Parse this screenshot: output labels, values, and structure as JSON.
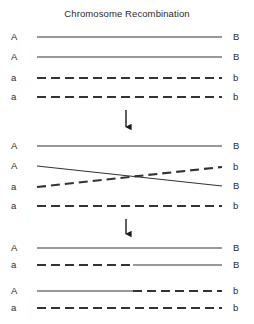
{
  "figure": {
    "title": "Chromosome Recombination",
    "width": 254,
    "height": 324,
    "background": "#ffffff",
    "stroke_color": "#333333",
    "text_color": "#2b2b2b"
  },
  "geometry": {
    "line_start_x": 37,
    "line_end_x": 222,
    "left_label_x": 11,
    "right_label_x": 233,
    "dash_pattern": "9 5",
    "solid_stroke_width": 1.1,
    "dashed_stroke_width": 2.2,
    "crossover_x": 100,
    "recombination_switch_x": 133
  },
  "stages": [
    {
      "id": "stage-1-homologous-pairing",
      "name": "Homologous chromosome pair",
      "chromatids": [
        {
          "id": "s1-c1",
          "left_label": "A",
          "right_label": "B",
          "y": 37,
          "style": "solid",
          "segments": [
            {
              "from_x": 37,
              "to_x": 222,
              "from_y": 37,
              "to_y": 37,
              "style": "solid"
            }
          ]
        },
        {
          "id": "s1-c2",
          "left_label": "A",
          "right_label": "B",
          "y": 57,
          "style": "solid",
          "segments": [
            {
              "from_x": 37,
              "to_x": 222,
              "from_y": 57,
              "to_y": 57,
              "style": "solid"
            }
          ]
        },
        {
          "id": "s1-c3",
          "left_label": "a",
          "right_label": "b",
          "y": 78,
          "style": "dashed",
          "segments": [
            {
              "from_x": 37,
              "to_x": 222,
              "from_y": 78,
              "to_y": 78,
              "style": "dashed"
            }
          ]
        },
        {
          "id": "s1-c4",
          "left_label": "a",
          "right_label": "b",
          "y": 97,
          "style": "dashed",
          "segments": [
            {
              "from_x": 37,
              "to_x": 222,
              "from_y": 97,
              "to_y": 97,
              "style": "dashed"
            }
          ]
        }
      ]
    },
    {
      "id": "stage-2-crossover",
      "name": "Crossover / chiasma formation",
      "chromatids": [
        {
          "id": "s2-c1",
          "left_label": "A",
          "right_label": "B",
          "y": 146,
          "style": "solid",
          "segments": [
            {
              "from_x": 37,
              "to_x": 222,
              "from_y": 146,
              "to_y": 146,
              "style": "solid"
            }
          ]
        },
        {
          "id": "s2-c2",
          "left_label": "A",
          "right_label": "B",
          "y": 166,
          "style": "solid",
          "segments": [
            {
              "from_x": 37,
              "to_x": 222,
              "from_y": 166,
              "to_y": 186,
              "style": "solid"
            }
          ]
        },
        {
          "id": "s2-c3",
          "left_label": "a",
          "right_label": "b",
          "y": 187,
          "style": "dashed",
          "segments": [
            {
              "from_x": 37,
              "to_x": 222,
              "from_y": 187,
              "to_y": 167,
              "style": "dashed"
            }
          ]
        },
        {
          "id": "s2-c4",
          "left_label": "a",
          "right_label": "b",
          "y": 206,
          "style": "dashed",
          "segments": [
            {
              "from_x": 37,
              "to_x": 222,
              "from_y": 206,
              "to_y": 206,
              "style": "dashed"
            }
          ]
        }
      ]
    },
    {
      "id": "stage-3-recombinant-products",
      "name": "Recombinant and parental chromatids",
      "chromatids": [
        {
          "id": "s3-c1",
          "left_label": "A",
          "right_label": "B",
          "y": 248,
          "style": "solid",
          "segments": [
            {
              "from_x": 37,
              "to_x": 222,
              "from_y": 248,
              "to_y": 248,
              "style": "solid"
            }
          ]
        },
        {
          "id": "s3-c2",
          "left_label": "a",
          "right_label": "B",
          "y": 265,
          "style": "mixed",
          "segments": [
            {
              "from_x": 37,
              "to_x": 133,
              "from_y": 265,
              "to_y": 265,
              "style": "dashed"
            },
            {
              "from_x": 133,
              "to_x": 222,
              "from_y": 265,
              "to_y": 265,
              "style": "solid"
            }
          ]
        },
        {
          "id": "s3-c3",
          "left_label": "A",
          "right_label": "b",
          "y": 291,
          "style": "mixed",
          "segments": [
            {
              "from_x": 37,
              "to_x": 133,
              "from_y": 291,
              "to_y": 291,
              "style": "solid"
            },
            {
              "from_x": 133,
              "to_x": 222,
              "from_y": 291,
              "to_y": 291,
              "style": "dashed"
            }
          ]
        },
        {
          "id": "s3-c4",
          "left_label": "a",
          "right_label": "b",
          "y": 308,
          "style": "dashed",
          "segments": [
            {
              "from_x": 37,
              "to_x": 222,
              "from_y": 308,
              "to_y": 308,
              "style": "dashed"
            }
          ]
        }
      ]
    }
  ],
  "arrows": [
    {
      "id": "arrow-1",
      "direction": "down",
      "x": 126,
      "from_y": 110,
      "to_y": 133
    },
    {
      "id": "arrow-2",
      "direction": "down",
      "x": 126,
      "from_y": 219,
      "to_y": 240
    }
  ]
}
